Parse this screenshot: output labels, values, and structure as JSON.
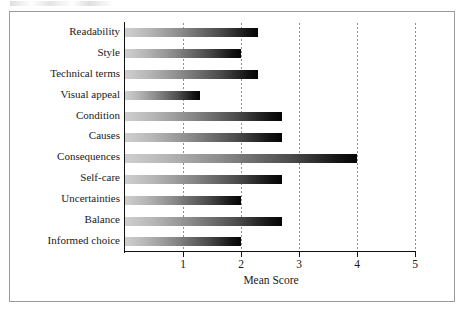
{
  "chart_data": {
    "type": "bar",
    "orientation": "horizontal",
    "title": "",
    "xlabel": "Mean Score",
    "ylabel": "",
    "xlim": [
      0,
      5
    ],
    "xticks": [
      "1",
      "2",
      "3",
      "4",
      "5"
    ],
    "xtick_values": [
      1,
      2,
      3,
      4,
      5
    ],
    "grid": "vertical-dotted",
    "legend": "none",
    "categories": [
      "Readability",
      "Style",
      "Technical terms",
      "Visual appeal",
      "Condition",
      "Causes",
      "Consequences",
      "Self-care",
      "Uncertainties",
      "Balance",
      "Informed choice"
    ],
    "values": [
      2.3,
      2.0,
      2.3,
      1.3,
      2.7,
      2.7,
      4.0,
      2.7,
      2.0,
      2.7,
      2.0
    ],
    "bar_style": {
      "fill": "gradient",
      "gradient_from": "#cfcfcf",
      "gradient_to": "#050505"
    }
  },
  "axes": {
    "x_axis_title": "Mean Score",
    "x_tick_labels": [
      "1",
      "2",
      "3",
      "4",
      "5"
    ]
  },
  "colors": {
    "frame_border": "#9a9a9a",
    "axis": "#111111",
    "gridline": "#8f8f8f",
    "text": "#1a1a1a",
    "background": "#ffffff"
  }
}
